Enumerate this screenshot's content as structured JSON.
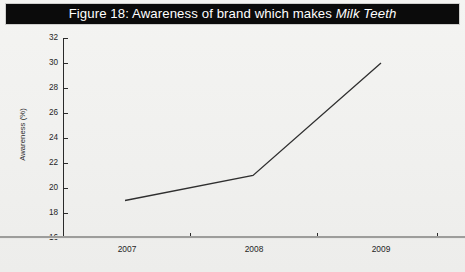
{
  "figure": {
    "title_prefix": "Figure 18: Awareness of brand which makes ",
    "title_emphasis": "Milk Teeth",
    "title_full": "Figure 18: Awareness of brand which makes Milk Teeth",
    "title_band_color": "#0b0b0b",
    "title_text_color": "#ffffff",
    "background_color": "#f1f1ef"
  },
  "chart_data": {
    "type": "line",
    "title": "Figure 18: Awareness of brand which makes Milk Teeth",
    "xlabel": "",
    "ylabel": "Awareness (%)",
    "categories": [
      "2007",
      "2008",
      "2009"
    ],
    "x": [
      2007,
      2008,
      2009
    ],
    "values": [
      19,
      21,
      30
    ],
    "series": [
      {
        "name": "Awareness (%)",
        "values": [
          19,
          21,
          30
        ],
        "color": "#2f2f2f"
      }
    ],
    "ylim": [
      16,
      32
    ],
    "yticks": [
      16,
      18,
      20,
      22,
      24,
      26,
      28,
      30,
      32
    ],
    "ytick_labels": [
      "16",
      "18",
      "20",
      "22",
      "24",
      "26",
      "28",
      "30",
      "32"
    ],
    "xticks": [
      "2007",
      "2008",
      "2009"
    ],
    "grid": false,
    "legend": false,
    "legend_position": "none",
    "markers": false,
    "line_color": "#2f2f2f",
    "line_width": 1.3
  },
  "axes": {
    "y_axis_label": "Awareness (%)",
    "y_tick_0": "16",
    "y_tick_1": "18",
    "y_tick_2": "20",
    "y_tick_3": "22",
    "y_tick_4": "24",
    "y_tick_5": "26",
    "y_tick_6": "28",
    "y_tick_7": "30",
    "y_tick_8": "32",
    "x_tick_0": "2007",
    "x_tick_1": "2008",
    "x_tick_2": "2009"
  }
}
